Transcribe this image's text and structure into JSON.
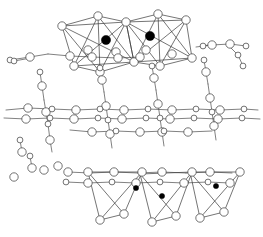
{
  "figure": {
    "type": "crystal-structure-diagram",
    "width": 263,
    "height": 237,
    "background_color": "#ffffff",
    "bond_color": "#4a4a4a",
    "polyhedron_edge_color": "#3a3a3a",
    "open_atom_fill": "#ffffff",
    "open_atom_stroke": "#444444",
    "filled_atom_color": "#000000",
    "layers": [
      {
        "name": "upper-octahedral-layer",
        "description": "Two corner/edge-sharing octahedra with large filled central cations"
      },
      {
        "name": "middle-chain-layer",
        "description": "Two parallel horizontal chains of linked open atoms with vertical bridging bonds"
      },
      {
        "name": "lower-tetrahedral-layer",
        "description": "Three downward-pointing tetrahedra with small filled central cations"
      }
    ],
    "atom_species": [
      {
        "name": "open-large-atom",
        "style": "open-circle",
        "radius": 4.2,
        "count_note": "framework anion / oxygen sites"
      },
      {
        "name": "open-small-atom",
        "style": "open-circle",
        "radius": 2.9,
        "count_note": "secondary framework sites"
      },
      {
        "name": "filled-large-atom",
        "style": "black-circle",
        "radius": 4.6,
        "count_note": "octahedral cation centers"
      },
      {
        "name": "filled-small-atom",
        "style": "black-circle",
        "radius": 2.6,
        "count_note": "tetrahedral cation centers"
      }
    ],
    "bonds": [
      [
        10,
        60,
        30,
        57
      ],
      [
        30,
        57,
        48,
        54
      ],
      [
        48,
        54,
        70,
        56
      ],
      [
        70,
        56,
        92,
        57
      ],
      [
        14,
        61,
        31,
        58
      ],
      [
        92,
        57,
        118,
        58
      ],
      [
        118,
        58,
        140,
        57
      ],
      [
        196,
        47,
        212,
        45
      ],
      [
        212,
        45,
        230,
        44
      ],
      [
        230,
        44,
        246,
        46
      ],
      [
        203,
        46,
        214,
        44
      ],
      [
        228,
        45,
        238,
        55
      ],
      [
        238,
        55,
        243,
        66
      ],
      [
        100,
        68,
        102,
        80
      ],
      [
        102,
        80,
        104,
        92
      ],
      [
        40,
        72,
        42,
        86
      ],
      [
        42,
        86,
        44,
        100
      ],
      [
        152,
        66,
        154,
        78
      ],
      [
        154,
        78,
        156,
        90
      ],
      [
        204,
        60,
        206,
        72
      ],
      [
        206,
        72,
        208,
        84
      ],
      [
        6,
        110,
        28,
        108
      ],
      [
        28,
        108,
        52,
        109
      ],
      [
        52,
        109,
        76,
        110
      ],
      [
        76,
        110,
        100,
        109
      ],
      [
        100,
        109,
        124,
        110
      ],
      [
        124,
        110,
        148,
        109
      ],
      [
        148,
        109,
        172,
        110
      ],
      [
        172,
        110,
        196,
        109
      ],
      [
        196,
        109,
        220,
        110
      ],
      [
        220,
        110,
        244,
        109
      ],
      [
        244,
        109,
        258,
        110
      ],
      [
        4,
        118,
        26,
        119
      ],
      [
        26,
        119,
        50,
        118
      ],
      [
        50,
        118,
        74,
        119
      ],
      [
        74,
        119,
        98,
        118
      ],
      [
        98,
        118,
        122,
        119
      ],
      [
        122,
        119,
        146,
        118
      ],
      [
        146,
        118,
        170,
        119
      ],
      [
        170,
        119,
        194,
        118
      ],
      [
        194,
        118,
        218,
        119
      ],
      [
        218,
        119,
        242,
        118
      ],
      [
        242,
        118,
        260,
        119
      ],
      [
        44,
        100,
        46,
        112
      ],
      [
        46,
        112,
        48,
        124
      ],
      [
        104,
        92,
        106,
        106
      ],
      [
        106,
        106,
        108,
        120
      ],
      [
        156,
        90,
        158,
        104
      ],
      [
        158,
        104,
        160,
        118
      ],
      [
        208,
        84,
        210,
        98
      ],
      [
        210,
        98,
        212,
        112
      ],
      [
        48,
        124,
        50,
        140
      ],
      [
        50,
        140,
        52,
        152
      ],
      [
        108,
        120,
        110,
        134
      ],
      [
        110,
        134,
        112,
        148
      ],
      [
        160,
        118,
        162,
        132
      ],
      [
        162,
        132,
        164,
        146
      ],
      [
        212,
        112,
        214,
        126
      ],
      [
        214,
        126,
        216,
        140
      ],
      [
        70,
        130,
        92,
        132
      ],
      [
        92,
        132,
        116,
        131
      ],
      [
        116,
        131,
        140,
        132
      ],
      [
        140,
        132,
        164,
        131
      ],
      [
        164,
        131,
        188,
        132
      ],
      [
        188,
        132,
        212,
        131
      ],
      [
        20,
        140,
        22,
        152
      ],
      [
        30,
        156,
        32,
        168
      ],
      [
        68,
        172,
        90,
        173
      ],
      [
        90,
        173,
        114,
        172
      ],
      [
        114,
        172,
        138,
        173
      ],
      [
        138,
        173,
        162,
        172
      ],
      [
        162,
        172,
        186,
        173
      ],
      [
        186,
        173,
        210,
        172
      ],
      [
        210,
        172,
        232,
        173
      ],
      [
        66,
        182,
        88,
        183
      ],
      [
        88,
        183,
        112,
        182
      ],
      [
        112,
        182,
        136,
        183
      ],
      [
        136,
        183,
        160,
        182
      ],
      [
        160,
        182,
        184,
        183
      ],
      [
        184,
        183,
        208,
        182
      ],
      [
        208,
        182,
        230,
        183
      ]
    ],
    "polyhedra": [
      {
        "name": "octahedron-left",
        "kind": "octahedron",
        "center": [
          106,
          40
        ],
        "vertices": [
          [
            62,
            26
          ],
          [
            126,
            22
          ],
          [
            134,
            62
          ],
          [
            74,
            66
          ],
          [
            98,
            16
          ],
          [
            100,
            72
          ]
        ]
      },
      {
        "name": "octahedron-right",
        "kind": "octahedron",
        "center": [
          150,
          36
        ],
        "vertices": [
          [
            126,
            22
          ],
          [
            186,
            20
          ],
          [
            192,
            58
          ],
          [
            134,
            62
          ],
          [
            158,
            14
          ],
          [
            160,
            66
          ]
        ]
      },
      {
        "name": "tetrahedron-left",
        "kind": "tetrahedron",
        "center": [
          114,
          190
        ],
        "vertices": [
          [
            88,
            172
          ],
          [
            142,
            172
          ],
          [
            100,
            220
          ],
          [
            124,
            214
          ]
        ]
      },
      {
        "name": "tetrahedron-middle",
        "kind": "tetrahedron",
        "center": [
          164,
          194
        ],
        "vertices": [
          [
            140,
            174
          ],
          [
            192,
            172
          ],
          [
            152,
            222
          ],
          [
            176,
            216
          ]
        ]
      },
      {
        "name": "tetrahedron-right",
        "kind": "tetrahedron",
        "center": [
          214,
          190
        ],
        "vertices": [
          [
            190,
            172
          ],
          [
            240,
            172
          ],
          [
            200,
            218
          ],
          [
            224,
            212
          ]
        ]
      }
    ],
    "atoms_open_large": [
      [
        62,
        26
      ],
      [
        98,
        16
      ],
      [
        126,
        22
      ],
      [
        158,
        14
      ],
      [
        186,
        20
      ],
      [
        74,
        66
      ],
      [
        100,
        72
      ],
      [
        134,
        62
      ],
      [
        160,
        66
      ],
      [
        192,
        58
      ],
      [
        88,
        50
      ],
      [
        116,
        52
      ],
      [
        146,
        50
      ],
      [
        172,
        54
      ],
      [
        30,
        57
      ],
      [
        70,
        56
      ],
      [
        92,
        57
      ],
      [
        118,
        58
      ],
      [
        140,
        57
      ],
      [
        212,
        45
      ],
      [
        230,
        44
      ],
      [
        102,
        80
      ],
      [
        154,
        78
      ],
      [
        206,
        72
      ],
      [
        42,
        86
      ],
      [
        28,
        108
      ],
      [
        76,
        110
      ],
      [
        124,
        110
      ],
      [
        172,
        110
      ],
      [
        220,
        110
      ],
      [
        26,
        119
      ],
      [
        74,
        119
      ],
      [
        122,
        119
      ],
      [
        170,
        119
      ],
      [
        218,
        119
      ],
      [
        46,
        112
      ],
      [
        106,
        106
      ],
      [
        158,
        104
      ],
      [
        210,
        98
      ],
      [
        92,
        132
      ],
      [
        140,
        132
      ],
      [
        188,
        132
      ],
      [
        50,
        140
      ],
      [
        110,
        134
      ],
      [
        162,
        132
      ],
      [
        214,
        126
      ],
      [
        88,
        172
      ],
      [
        142,
        172
      ],
      [
        192,
        172
      ],
      [
        240,
        172
      ],
      [
        68,
        172
      ],
      [
        114,
        172
      ],
      [
        162,
        172
      ],
      [
        210,
        172
      ],
      [
        88,
        183
      ],
      [
        136,
        183
      ],
      [
        184,
        183
      ],
      [
        230,
        183
      ],
      [
        100,
        220
      ],
      [
        124,
        214
      ],
      [
        152,
        222
      ],
      [
        176,
        216
      ],
      [
        200,
        218
      ],
      [
        224,
        212
      ],
      [
        22,
        152
      ],
      [
        32,
        168
      ],
      [
        14,
        177
      ],
      [
        44,
        170
      ],
      [
        58,
        166
      ]
    ],
    "atoms_open_small": [
      [
        10,
        60
      ],
      [
        14,
        61
      ],
      [
        203,
        46
      ],
      [
        246,
        46
      ],
      [
        243,
        66
      ],
      [
        100,
        68
      ],
      [
        40,
        72
      ],
      [
        152,
        66
      ],
      [
        204,
        60
      ],
      [
        52,
        109
      ],
      [
        100,
        109
      ],
      [
        148,
        109
      ],
      [
        196,
        109
      ],
      [
        244,
        109
      ],
      [
        50,
        118
      ],
      [
        98,
        118
      ],
      [
        146,
        118
      ],
      [
        194,
        118
      ],
      [
        242,
        118
      ],
      [
        48,
        124
      ],
      [
        108,
        120
      ],
      [
        160,
        118
      ],
      [
        212,
        112
      ],
      [
        116,
        131
      ],
      [
        164,
        131
      ],
      [
        112,
        182
      ],
      [
        160,
        182
      ],
      [
        208,
        182
      ],
      [
        66,
        182
      ],
      [
        20,
        140
      ],
      [
        30,
        156
      ],
      [
        238,
        55
      ]
    ],
    "atoms_filled_large": [
      [
        106,
        40
      ],
      [
        150,
        36
      ]
    ],
    "atoms_filled_small": [
      [
        136,
        188
      ],
      [
        162,
        196
      ],
      [
        216,
        186
      ]
    ]
  }
}
